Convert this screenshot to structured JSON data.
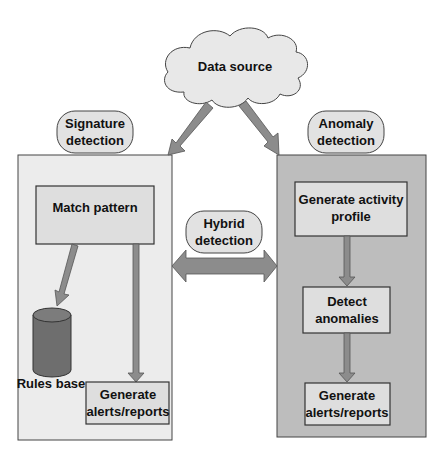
{
  "diagram": {
    "data_source": "Data source",
    "signature": {
      "title_line1": "Signature",
      "title_line2": "detection",
      "match_pattern": "Match pattern",
      "rules_base": "Rules base",
      "alerts_line1": "Generate",
      "alerts_line2": "alerts/reports"
    },
    "hybrid": {
      "line1": "Hybrid",
      "line2": "detection"
    },
    "anomaly": {
      "title_line1": "Anomaly",
      "title_line2": "detection",
      "profile_line1": "Generate  activity",
      "profile_line2": "profile",
      "detect_line1": "Detect",
      "detect_line2": "anomalies",
      "alerts_line1": "Generate",
      "alerts_line2": "alerts/reports"
    }
  },
  "colors": {
    "signature_panel": "#ececec",
    "anomaly_panel": "#bdbdbd",
    "box_fill": "#dedede",
    "arrow": "#8c8c8c",
    "cylinder": "#6e6e6e",
    "outline": "#3a3a3a"
  }
}
